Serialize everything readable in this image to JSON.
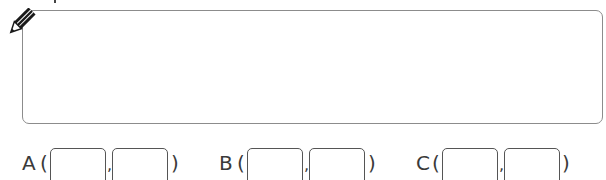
{
  "answer_area": {
    "icon": "pencil-icon",
    "value": ""
  },
  "coordinates": [
    {
      "label": "A",
      "open": "(",
      "sep": ",",
      "close": ")",
      "x_value": "",
      "y_value": ""
    },
    {
      "label": "B",
      "open": "(",
      "sep": ",",
      "close": ")",
      "x_value": "",
      "y_value": ""
    },
    {
      "label": "C",
      "open": "(",
      "sep": ",",
      "close": ")",
      "x_value": "",
      "y_value": ""
    }
  ],
  "colors": {
    "box_border": "#8c8c8c",
    "input_border": "#555555",
    "text": "#3a3a3a"
  }
}
